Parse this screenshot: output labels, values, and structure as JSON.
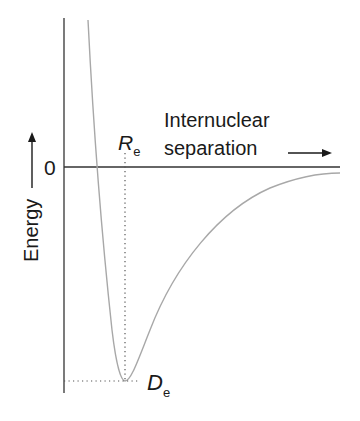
{
  "diagram": {
    "y_axis": {
      "label": "Energy",
      "arrow": "up-arrow",
      "zero_label": "0"
    },
    "x_axis": {
      "label_line1": "Internuclear",
      "label_line2": "separation",
      "arrow": "right-arrow"
    },
    "markers": {
      "equilibrium_distance": {
        "symbol": "R",
        "subscript": "e"
      },
      "dissociation_energy": {
        "symbol": "D",
        "subscript": "e"
      }
    },
    "colors": {
      "axes": "#333333",
      "curve": "#a8a8a8",
      "guides": "#555555",
      "text": "#1a1a1a"
    }
  }
}
